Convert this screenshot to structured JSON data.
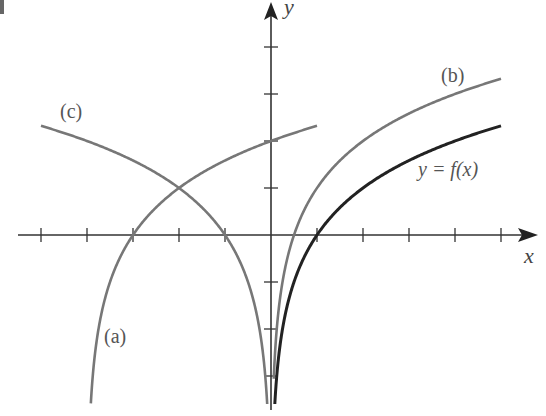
{
  "chart_data": {
    "type": "line",
    "title": "",
    "xlabel": "x",
    "ylabel": "y",
    "xlim": [
      -5,
      5
    ],
    "ylim": [
      -4,
      4.5
    ],
    "grid": false,
    "x_ticks": [
      -5,
      -4,
      -3,
      -2,
      -1,
      1,
      2,
      3,
      4,
      5
    ],
    "y_ticks": [
      -3,
      -2,
      -1,
      1,
      2,
      3,
      4
    ],
    "series": [
      {
        "name": "y = f(x)",
        "label": "y = f(x)",
        "color": "#222222",
        "formula": "log2(x)",
        "x_range": [
          0.03,
          5
        ],
        "x_intercept": 1
      },
      {
        "name": "(b)",
        "label": "(b)",
        "color": "#777777",
        "formula": "log2(x) + 1",
        "x_range": [
          0.06,
          5
        ],
        "x_intercept": 0.5
      },
      {
        "name": "(a)",
        "label": "(a)",
        "color": "#777777",
        "formula": "log2(x + 4)",
        "x_range": [
          -3.95,
          1
        ],
        "x_intercept": -3,
        "y_intercept": 2
      },
      {
        "name": "(c)",
        "label": "(c)",
        "color": "#777777",
        "formula": "log2(-x)",
        "x_range": [
          -5,
          -0.03
        ],
        "x_intercept": -1
      }
    ],
    "annotations": [
      {
        "text": "(a)",
        "near": [
          -3.6,
          -2.2
        ]
      },
      {
        "text": "(b)",
        "near": [
          4.2,
          2.9
        ]
      },
      {
        "text": "(c)",
        "near": [
          -4.4,
          2.6
        ]
      },
      {
        "text": "y = f(x)",
        "near": [
          4.2,
          1.1
        ]
      }
    ]
  },
  "labels": {
    "x_axis": "x",
    "y_axis": "y",
    "a": "(a)",
    "b": "(b)",
    "c": "(c)",
    "f": "y = f(x)"
  }
}
